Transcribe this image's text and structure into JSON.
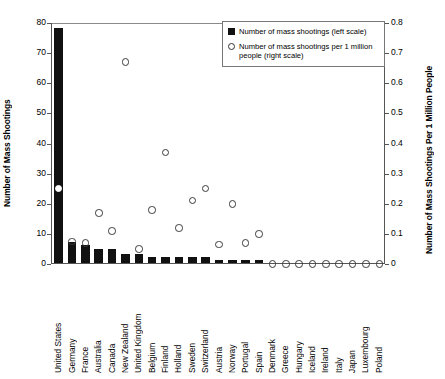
{
  "chart_data": {
    "type": "bar",
    "title": "",
    "xlabel": "",
    "ylabel": "Number of Mass Shootings",
    "ylabel_right": "Number of Mass Shootings Per 1 Million People",
    "ylim": [
      0,
      80
    ],
    "ylim_right": [
      0,
      0.8
    ],
    "yticks": [
      "0",
      "10",
      "20",
      "30",
      "40",
      "50",
      "60",
      "70",
      "80"
    ],
    "yticks_right": [
      "0",
      "0.1",
      "0.2",
      "0.3",
      "0.4",
      "0.5",
      "0.6",
      "0.7",
      "0.8"
    ],
    "grid": false,
    "legend_position": "top-right",
    "categories": [
      "United States",
      "Germany",
      "France",
      "Australia",
      "Canada",
      "New Zealand",
      "United Kingdom",
      "Belgium",
      "Finland",
      "Holland",
      "Sweden",
      "Switzerland",
      "Austria",
      "Norway",
      "Portugal",
      "Spain",
      "Denmark",
      "Greece",
      "Hungary",
      "Iceland",
      "Ireland",
      "Italy",
      "Japan",
      "Luxembourg",
      "Poland"
    ],
    "series": [
      {
        "name": "Number of mass shootings (left scale)",
        "axis": "left",
        "marker": "bar",
        "values": [
          78,
          7,
          6,
          4.5,
          4.5,
          3,
          3,
          2,
          2,
          2,
          2,
          2,
          1,
          1,
          1,
          1,
          0,
          0,
          0,
          0,
          0,
          0,
          0,
          0,
          0
        ]
      },
      {
        "name": "Number of mass shootings per 1 million people (right scale)",
        "axis": "right",
        "marker": "circle",
        "values": [
          0.25,
          0.075,
          0.07,
          0.17,
          0.11,
          0.67,
          0.05,
          0.18,
          0.37,
          0.12,
          0.21,
          0.25,
          0.065,
          0.2,
          0.07,
          0.1,
          0,
          0,
          0,
          0,
          0,
          0,
          0,
          0,
          0
        ]
      }
    ],
    "legend": [
      {
        "marker": "square",
        "label": "Number of mass shootings (left scale)"
      },
      {
        "marker": "circle",
        "label": "Number of mass shootings per 1 million people (right scale)"
      }
    ]
  }
}
